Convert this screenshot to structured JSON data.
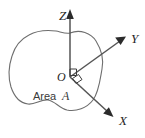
{
  "figure": {
    "background_color": "#ffffff",
    "outline_color": "#6e6e6e",
    "axis_color": "#555555",
    "arrow_color": "#2b2b2b",
    "label_color": "#262626",
    "origin": {
      "label": "O",
      "x": 70,
      "y": 77
    },
    "area": {
      "label_prefix": "Area",
      "label_symbol": "A",
      "label_x": 33,
      "label_y": 100,
      "outline_path": "M 70 33 C 80 29, 91 33, 96 41 C 101 49, 104 59, 102 69 C 100 80, 99 92, 93 100 C 87 108, 76 112, 67 110 C 59 108, 55 101, 48 100 C 41 99, 35 105, 28 104 C 20 103, 14 96, 11 87 C 8 77, 9 65, 12 56 C 15 46, 21 39, 29 35 C 38 30, 48 30, 56 31 C 61 32, 66 34, 70 33 Z"
    },
    "axes": [
      {
        "name": "z-axis",
        "label": "Z",
        "label_x": 59,
        "label_y": 20,
        "line": {
          "x1": 70,
          "y1": 77,
          "x2": 70,
          "y2": 16
        },
        "arrow_points": "70,9 66.2,19 73.8,19"
      },
      {
        "name": "y-axis",
        "label": "Y",
        "label_x": 131,
        "label_y": 43,
        "line": {
          "x1": 70,
          "y1": 77,
          "x2": 120,
          "y2": 41
        },
        "arrow_points": "126,36.5 115.2,37.6 120.6,45.1"
      },
      {
        "name": "x-axis",
        "label": "X",
        "label_x": 119,
        "label_y": 125,
        "line": {
          "x1": 70,
          "y1": 77,
          "x2": 108,
          "y2": 112
        },
        "arrow_points": "113.5,117 108.9,107.2 103.2,113.4"
      }
    ],
    "angle_markers": [
      {
        "name": "right-angle-marker-zy",
        "path": "M 70 69 L 76.5 69 L 76.5 75.5 L 70 75.5 Z"
      },
      {
        "name": "right-angle-marker-yx",
        "path": "M 72.5 78.5 L 78.5 74.5 L 82 79.5 L 76 83.5 Z"
      }
    ]
  }
}
